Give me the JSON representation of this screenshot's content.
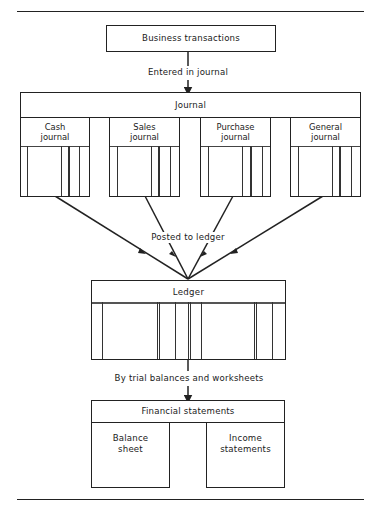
{
  "diagram": {
    "type": "accounting-cycle-flow",
    "nodes": {
      "business": {
        "label": "Business transactions"
      },
      "journal": {
        "label": "Journal",
        "sub_journals": [
          {
            "label_line1": "Cash",
            "label_line2": "journal"
          },
          {
            "label_line1": "Sales",
            "label_line2": "journal"
          },
          {
            "label_line1": "Purchase",
            "label_line2": "journal"
          },
          {
            "label_line1": "General",
            "label_line2": "journal"
          }
        ]
      },
      "ledger": {
        "label": "Ledger"
      },
      "financial_statements": {
        "label": "Financial statements",
        "children": [
          {
            "label_line1": "Balance",
            "label_line2": "sheet"
          },
          {
            "label_line1": "Income",
            "label_line2": "statements"
          }
        ]
      }
    },
    "edges": [
      {
        "from": "business",
        "to": "journal",
        "label": "Entered in journal"
      },
      {
        "from": "journal",
        "to": "ledger",
        "label": "Posted to ledger"
      },
      {
        "from": "ledger",
        "to": "financial_statements",
        "label": "By trial balances and worksheets"
      }
    ]
  },
  "colors": {
    "line": "#222222",
    "background": "#ffffff"
  }
}
